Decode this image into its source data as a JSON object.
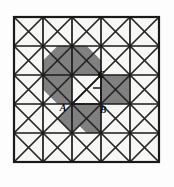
{
  "figure": {
    "kind": "geometry-diagram",
    "colors": {
      "background": "#fdfdfd",
      "cell_fill": "#f7f7f5",
      "shade_fill": "#808080",
      "grid_line": "#1a1a1a",
      "diagonal_line": "#262626",
      "label_text": "#0a0a0a"
    },
    "grid": {
      "rows": 5,
      "columns": 5,
      "cell_size": 29,
      "origin_x": 14,
      "origin_y": 17,
      "outer_border_width": 2.2,
      "inner_line_width": 1.7,
      "diagonal_line_width": 1.7,
      "diagonals_per_cell": 2,
      "x_lines": [
        14,
        43,
        72,
        101,
        130,
        159
      ],
      "y_lines": [
        17,
        46,
        75,
        104,
        133,
        162
      ]
    },
    "shaded_polygons": [
      {
        "name": "upper-left-diamond",
        "points": "57.5,46 86.5,46 101,60.5 101,75 72,75 43,75 43,60.5"
      },
      {
        "name": "left-wedge",
        "points": "43,75 72,75 86.5,89.5 72,104 57.5,104 43,89.5"
      },
      {
        "name": "lower-center-triangle",
        "points": "72,104 101,104 101,133 86.5,133 72,118.5"
      },
      {
        "name": "lower-left-fill",
        "points": "72,104 86.5,118.5 72,133 57.5,118.5"
      },
      {
        "name": "right-square-upper",
        "points": "101,75 130,75 130,104 101,104"
      },
      {
        "name": "center-top-triangle",
        "points": "72,46 86.5,46 101,60.5 101,75 72,75"
      }
    ],
    "white_notch": {
      "name": "unshaded-notch",
      "points": "72,75 101,75 101,104 72,104"
    },
    "inner_triangle": {
      "vertices": [
        "A",
        "B",
        "C"
      ],
      "edges": [
        {
          "from": "A",
          "to": "B"
        },
        {
          "from": "B",
          "to": "C"
        },
        {
          "from": "C",
          "to": "A"
        }
      ]
    },
    "right_angle_marker": {
      "at_vertex": "B",
      "size": 8,
      "x": 93,
      "y": 88
    },
    "labels": [
      {
        "id": "label-a",
        "text": "A",
        "x": 63,
        "y": 111,
        "point_x": 72,
        "point_y": 104
      },
      {
        "id": "label-b",
        "text": "B",
        "x": 103,
        "y": 113,
        "point_x": 101,
        "point_y": 104
      },
      {
        "id": "label-c",
        "text": "C",
        "x": 101,
        "y": 78,
        "point_x": 101,
        "point_y": 75
      }
    ]
  }
}
